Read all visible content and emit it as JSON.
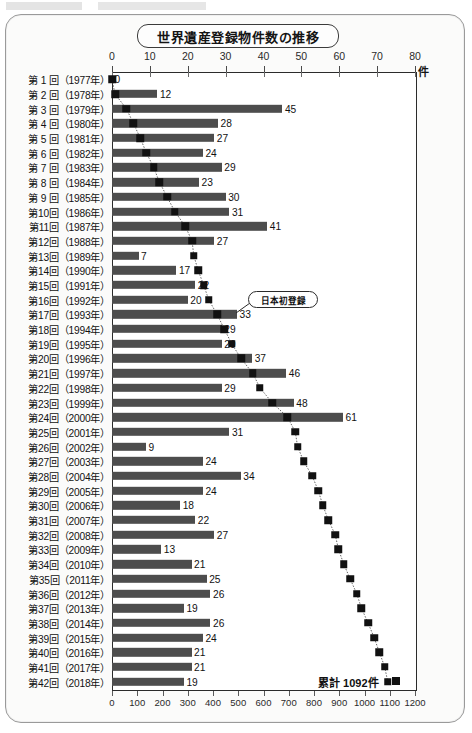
{
  "chart_data": {
    "type": "bar",
    "title": "世界遺産登録物件数の推移",
    "xlabel": "件",
    "ylabel": "",
    "orientation": "horizontal",
    "grid": false,
    "legend": "none",
    "top_axis": {
      "label": "件",
      "ticks": [
        0,
        10,
        20,
        30,
        40,
        50,
        60,
        70,
        80
      ],
      "range": [
        0,
        80
      ],
      "series_name": "登録件数"
    },
    "bottom_axis": {
      "ticks": [
        0,
        100,
        200,
        300,
        400,
        500,
        600,
        700,
        800,
        900,
        1000,
        1100,
        1200
      ],
      "range": [
        0,
        1200
      ],
      "series_name": "累計件数"
    },
    "categories": [
      "第 1 回（1977年）",
      "第 2 回（1978年）",
      "第 3 回（1979年）",
      "第 4 回（1980年）",
      "第 5 回（1981年）",
      "第 6 回（1982年）",
      "第 7 回（1983年）",
      "第 8 回（1984年）",
      "第 9 回（1985年）",
      "第10回（1986年）",
      "第11回（1987年）",
      "第12回（1988年）",
      "第13回（1989年）",
      "第14回（1990年）",
      "第15回（1991年）",
      "第16回（1992年）",
      "第17回（1993年）",
      "第18回（1994年）",
      "第19回（1995年）",
      "第20回（1996年）",
      "第21回（1997年）",
      "第22回（1998年）",
      "第23回（1999年）",
      "第24回（2000年）",
      "第25回（2001年）",
      "第26回（2002年）",
      "第27回（2003年）",
      "第28回（2004年）",
      "第29回（2005年）",
      "第30回（2006年）",
      "第31回（2007年）",
      "第32回（2008年）",
      "第33回（2009年）",
      "第34回（2010年）",
      "第35回（2011年）",
      "第36回（2012年）",
      "第37回（2013年）",
      "第38回（2014年）",
      "第39回（2015年）",
      "第40回（2016年）",
      "第41回（2017年）",
      "第42回（2018年）"
    ],
    "values": [
      0,
      12,
      45,
      28,
      27,
      24,
      29,
      23,
      30,
      31,
      41,
      27,
      7,
      17,
      22,
      20,
      33,
      29,
      29,
      37,
      46,
      29,
      48,
      61,
      31,
      9,
      24,
      34,
      24,
      18,
      22,
      27,
      13,
      21,
      25,
      26,
      19,
      26,
      24,
      21,
      21,
      19
    ],
    "cumulative": [
      0,
      12,
      57,
      85,
      112,
      136,
      165,
      188,
      218,
      249,
      290,
      317,
      324,
      341,
      363,
      383,
      416,
      445,
      474,
      511,
      557,
      586,
      634,
      695,
      726,
      735,
      759,
      793,
      817,
      835,
      857,
      884,
      897,
      918,
      943,
      969,
      988,
      1014,
      1038,
      1059,
      1080,
      1092
    ],
    "annotations": [
      {
        "text": "日本初登録",
        "target_category": "第17回（1993年）"
      },
      {
        "text": "累計 1092件",
        "value": 1092
      }
    ]
  }
}
